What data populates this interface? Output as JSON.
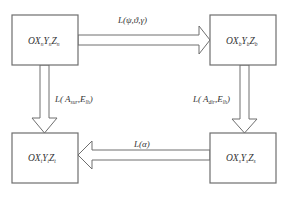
{
  "diagram": {
    "type": "coordinate-frame-transformation",
    "nodes": [
      {
        "id": "top-left",
        "prefix": "OX",
        "y": "Y",
        "z": "Z",
        "subscript": "n",
        "text": "OXnYnZn"
      },
      {
        "id": "top-right",
        "prefix": "OX",
        "y": "Y",
        "z": "Z",
        "subscript": "b",
        "text": "OXbYbZb"
      },
      {
        "id": "bottom-right",
        "prefix": "OX",
        "y": "Y",
        "z": "Z",
        "subscript": "s",
        "text": "OXsYsZs"
      },
      {
        "id": "bottom-left",
        "prefix": "OX",
        "y": "Y",
        "z": "Z",
        "subscript": "t",
        "text": "OXtYtZt"
      }
    ],
    "edges": [
      {
        "from": "top-left",
        "to": "top-right",
        "label": "L(ψ,ϑ,γ)"
      },
      {
        "from": "top-right",
        "to": "bottom-right",
        "label_main": "L( A",
        "label_sub1": "dir",
        "label_mid": ",E",
        "label_sub2": "lh",
        "label_end": ")"
      },
      {
        "from": "bottom-right",
        "to": "bottom-left",
        "label": "L(α)"
      },
      {
        "from": "top-left",
        "to": "bottom-left",
        "label_main": "L( A",
        "label_sub1": "sur",
        "label_mid": ",E",
        "label_sub2": "lh",
        "label_end": ")"
      }
    ],
    "colors": {
      "stroke": "#6e6e6e",
      "text": "#333333",
      "background": "#ffffff"
    }
  }
}
